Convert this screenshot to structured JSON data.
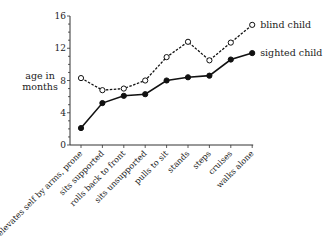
{
  "chart_data": {
    "type": "line",
    "title": "",
    "xlabel": "",
    "ylabel": "age in months",
    "ylabel_lines": [
      "age in",
      "months"
    ],
    "ylim": [
      0,
      16
    ],
    "yticks": [
      0,
      4,
      8,
      12,
      16
    ],
    "grid": false,
    "legend_position": "inline-right",
    "categories": [
      "elevates self by arms, prone",
      "sits supported",
      "rolls back to front",
      "sits unsupported",
      "pulls to sit",
      "stands",
      "steps",
      "cruises",
      "walks alone"
    ],
    "series": [
      {
        "name": "blind child",
        "marker": "open-circle",
        "line": "dashed",
        "values": [
          8.3,
          6.8,
          7.0,
          8.0,
          10.9,
          12.8,
          10.5,
          12.7,
          14.9
        ]
      },
      {
        "name": "sighted child",
        "marker": "filled-circle",
        "line": "solid",
        "values": [
          2.1,
          5.2,
          6.1,
          6.3,
          8.0,
          8.4,
          8.6,
          10.6,
          11.4
        ]
      }
    ]
  }
}
